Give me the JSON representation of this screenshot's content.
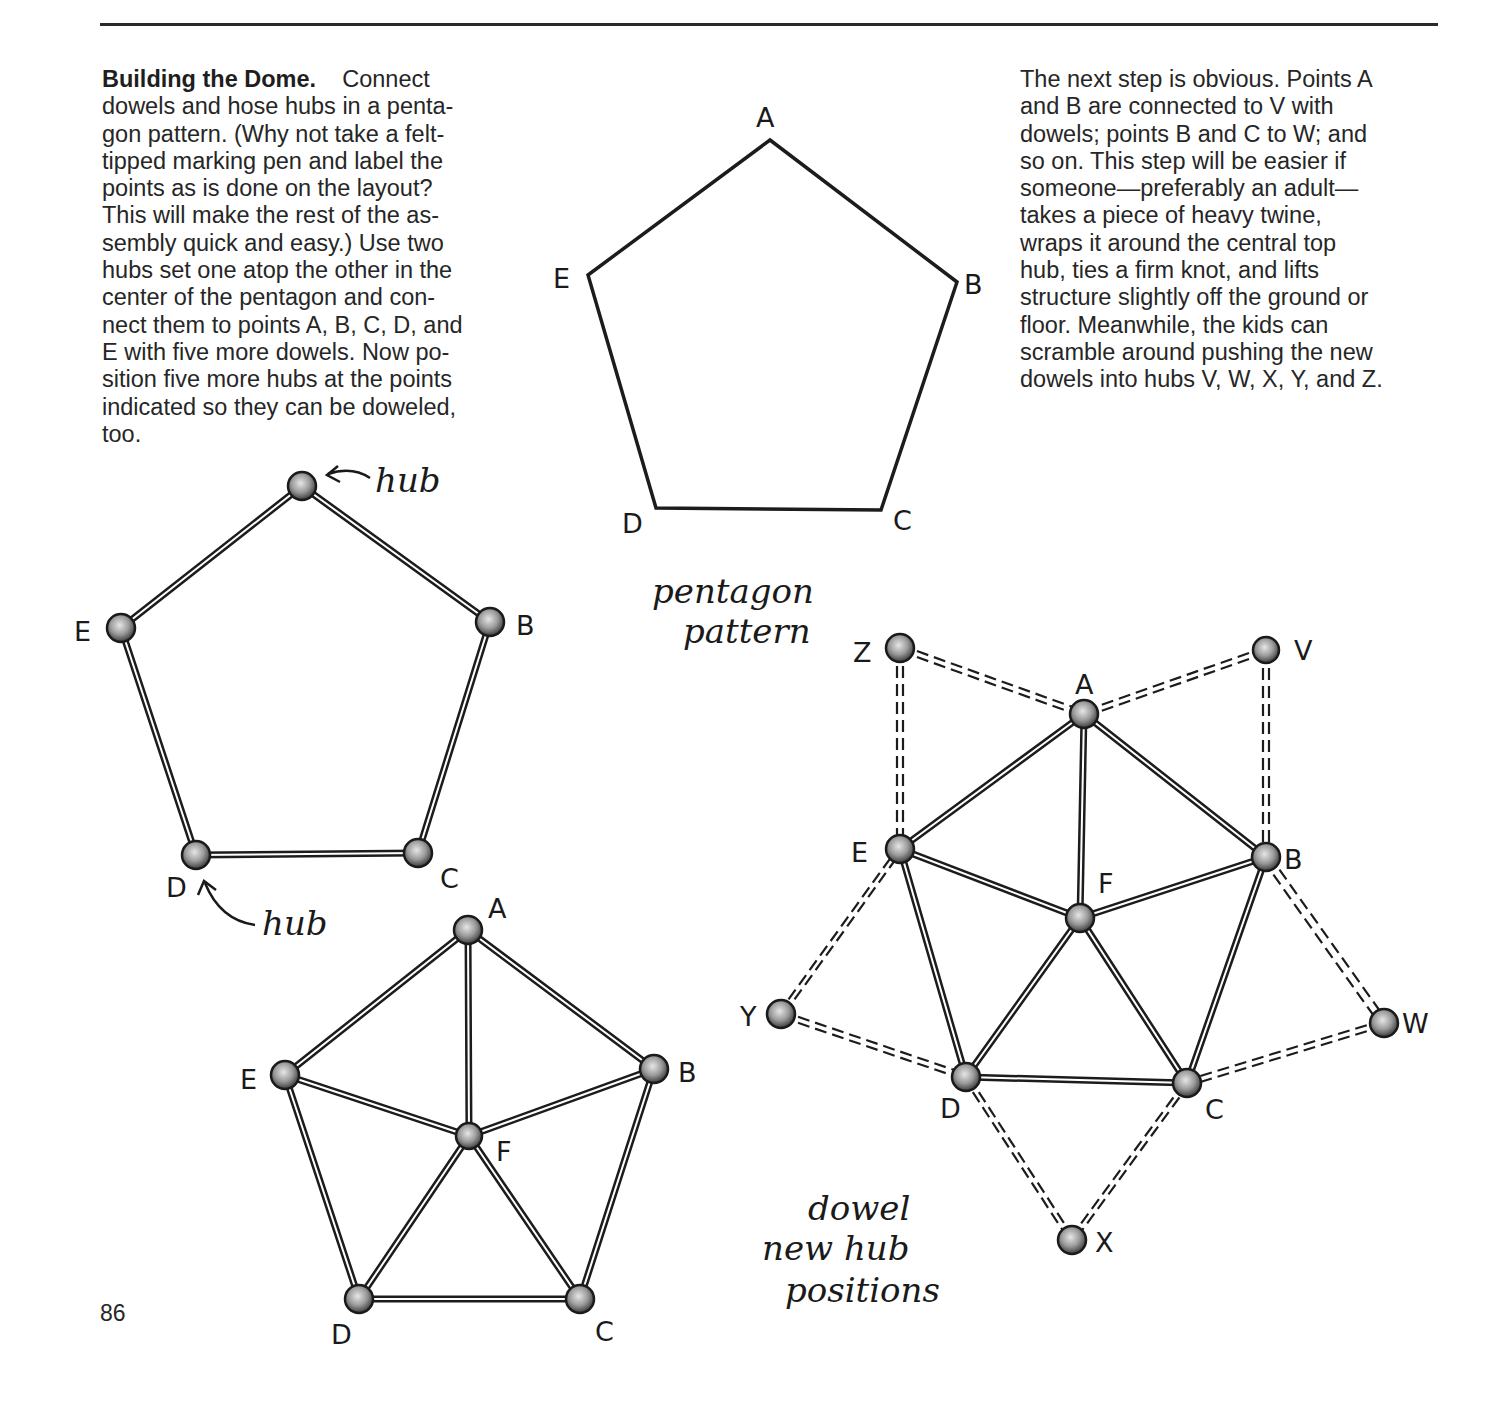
{
  "page": {
    "number": "86"
  },
  "left_text": {
    "heading": "Building the Dome.",
    "lines": [
      "Connect",
      "dowels and hose hubs in a penta-",
      "gon pattern. (Why not take a felt-",
      "tipped marking pen and label the",
      "points as is done on the layout?",
      "This will make the rest of the as-",
      "sembly quick and easy.) Use two",
      "hubs set one atop the other in the",
      "center of the pentagon and con-",
      "nect them to points A, B, C, D, and",
      "E with five more dowels. Now po-",
      "sition five more hubs at the points",
      "indicated so they can be doweled,",
      "too."
    ]
  },
  "right_text": {
    "lines": [
      "The next step is obvious. Points A",
      "and B are connected to V with",
      "dowels; points B and C to W; and",
      "so on. This step will be easier if",
      "someone—preferably an adult—",
      "takes a piece of heavy twine,",
      "wraps it around the central top",
      "hub, ties a firm knot, and lifts",
      "structure slightly off the ground or",
      "floor. Meanwhile, the kids can",
      "scramble around pushing the new",
      "dowels into hubs V, W, X, Y, and Z."
    ]
  },
  "diagrams": {
    "pentagon_layout": {
      "caption_lines": [
        "pentagon",
        "pattern"
      ],
      "labels": {
        "A": "A",
        "B": "B",
        "C": "C",
        "D": "D",
        "E": "E"
      }
    },
    "hub_pentagon": {
      "labels": {
        "B": "B",
        "C": "C",
        "D": "D",
        "E": "E"
      },
      "annotation_top": "hub",
      "annotation_bottom": "hub"
    },
    "center_hub_pentagon": {
      "labels": {
        "A": "A",
        "B": "B",
        "C": "C",
        "D": "D",
        "E": "E",
        "F": "F"
      }
    },
    "expanded_dome": {
      "labels": {
        "A": "A",
        "B": "B",
        "C": "C",
        "D": "D",
        "E": "E",
        "F": "F",
        "V": "V",
        "W": "W",
        "X": "X",
        "Y": "Y",
        "Z": "Z"
      },
      "legend_lines": [
        "dowel",
        "new hub",
        "positions"
      ]
    }
  }
}
